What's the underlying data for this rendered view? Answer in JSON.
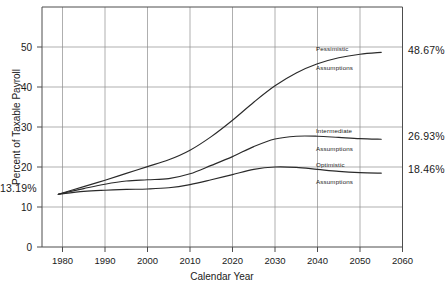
{
  "chart_data": {
    "type": "line",
    "title": "",
    "xlabel": "Calendar Year",
    "ylabel": "Percent of Taxable Payroll",
    "xlim": [
      1975,
      2062
    ],
    "ylim": [
      0,
      57
    ],
    "xticks": [
      "1980",
      "1990",
      "2000",
      "2010",
      "2020",
      "2030",
      "2040",
      "2050",
      "2060"
    ],
    "xtick_values": [
      1980,
      1990,
      2000,
      2010,
      2020,
      2030,
      2040,
      2050,
      2060
    ],
    "yticks": [
      "0",
      "10",
      "20",
      "30",
      "40",
      "50"
    ],
    "ytick_values": [
      0,
      10,
      20,
      30,
      40,
      50
    ],
    "grid": true,
    "legend": "inline-curve-labels",
    "start_value_label": "13.19%",
    "start_value": 13.19,
    "start_year": 1979,
    "series": [
      {
        "name": "Pessimistic Assumptions",
        "label_line1": "Pessimistic",
        "label_line2": "Assumptions",
        "end_label": "48.67%",
        "end_value": 48.67,
        "end_year": 2055,
        "x": [
          1979,
          1985,
          1990,
          1995,
          2000,
          2005,
          2010,
          2015,
          2020,
          2025,
          2030,
          2035,
          2040,
          2045,
          2050,
          2055
        ],
        "values": [
          13.19,
          15.1,
          16.7,
          18.4,
          20.1,
          21.8,
          24.2,
          27.6,
          31.7,
          36.2,
          40.3,
          43.5,
          45.8,
          47.3,
          48.2,
          48.67
        ]
      },
      {
        "name": "Intermediate Assumptions",
        "label_line1": "Intermediate",
        "label_line2": "Assumptions",
        "end_label": "26.93%",
        "end_value": 26.93,
        "end_year": 2055,
        "x": [
          1979,
          1985,
          1990,
          1995,
          2000,
          2005,
          2010,
          2015,
          2020,
          2025,
          2030,
          2035,
          2040,
          2045,
          2050,
          2055
        ],
        "values": [
          13.19,
          14.6,
          15.7,
          16.5,
          16.8,
          17.1,
          18.3,
          20.4,
          22.6,
          25.1,
          27.0,
          27.7,
          27.7,
          27.4,
          27.1,
          26.93
        ]
      },
      {
        "name": "Optimistic Assumptions",
        "label_line1": "Optimistic",
        "label_line2": "Assumptions",
        "end_label": "18.46%",
        "end_value": 18.46,
        "end_year": 2055,
        "x": [
          1979,
          1985,
          1990,
          1995,
          2000,
          2005,
          2010,
          2015,
          2020,
          2025,
          2030,
          2035,
          2040,
          2045,
          2050,
          2055
        ],
        "values": [
          13.19,
          13.9,
          14.2,
          14.4,
          14.5,
          14.8,
          15.6,
          16.8,
          18.1,
          19.4,
          20.0,
          19.9,
          19.4,
          18.9,
          18.6,
          18.46
        ]
      }
    ],
    "colors": {
      "line": "#2a2a2a",
      "grid": "#8c8c8c",
      "frame": "#4d4d4d",
      "text": "#1a1a1a",
      "background": "#ffffff"
    }
  }
}
